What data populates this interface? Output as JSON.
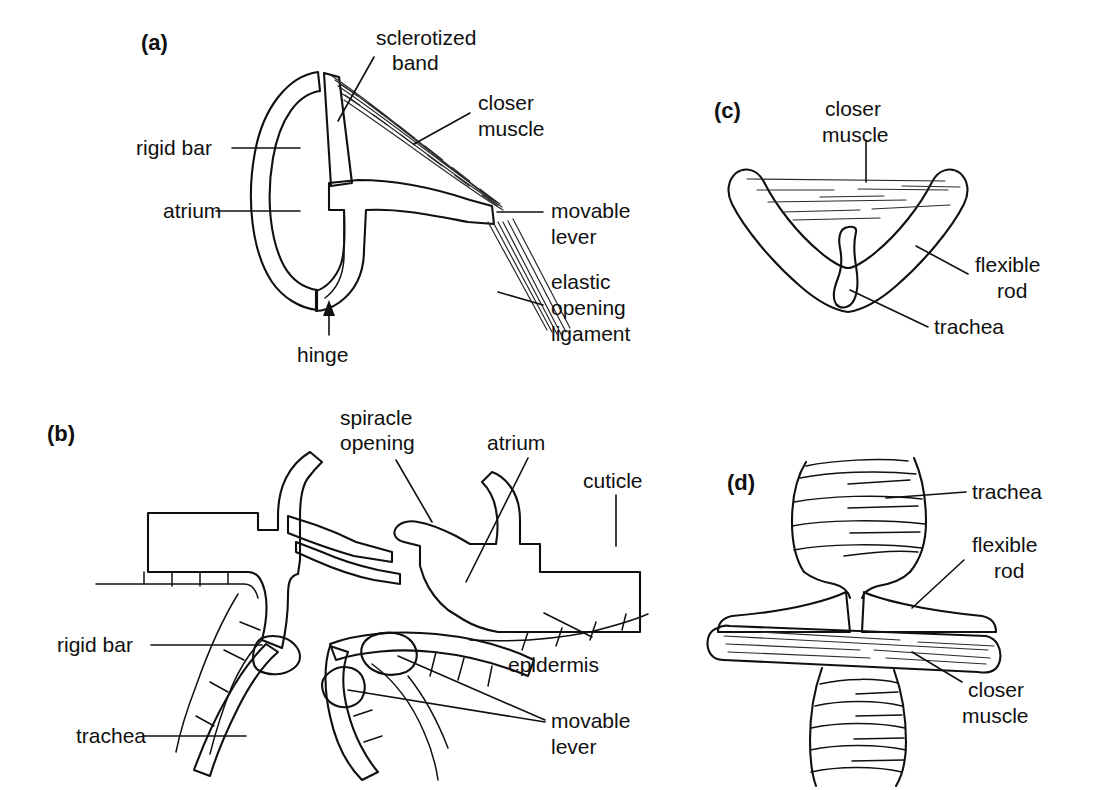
{
  "figure": {
    "background_color": "#ffffff",
    "ink_color": "#101010",
    "panels": [
      {
        "id": "a",
        "letter": "(a)",
        "description": "Lateral view of a spiracle with rigid bar, movable lever, closer muscle and elastic opening ligament",
        "labels": [
          "sclerotized band",
          "closer muscle",
          "rigid bar",
          "atrium",
          "movable lever",
          "elastic opening ligament",
          "hinge"
        ]
      },
      {
        "id": "b",
        "letter": "(b)",
        "description": "Sectional view through the body wall showing spiracle opening, atrium, cuticle, epidermis, rigid bar, movable lever and trachea",
        "labels": [
          "spiracle opening",
          "atrium",
          "cuticle",
          "epidermis",
          "rigid bar",
          "movable lever",
          "trachea"
        ]
      },
      {
        "id": "c",
        "letter": "(c)",
        "description": "Cross-section of a tracheal closing device with flexible rod, closer muscle and trachea",
        "labels": [
          "closer muscle",
          "flexible rod",
          "trachea"
        ]
      },
      {
        "id": "d",
        "letter": "(d)",
        "description": "Longitudinal view of a tracheal closing device with trachea, flexible rod and closer muscle",
        "labels": [
          "trachea",
          "flexible rod",
          "closer muscle"
        ]
      }
    ]
  },
  "panel_a": {
    "letter": "(a)",
    "label_sclerotized_band_line1": "sclerotized",
    "label_sclerotized_band_line2": "band",
    "label_closer_muscle_line1": "closer",
    "label_closer_muscle_line2": "muscle",
    "label_rigid_bar": "rigid bar",
    "label_atrium": "atrium",
    "label_movable_lever_line1": "movable",
    "label_movable_lever_line2": "lever",
    "label_elastic_line1": "elastic",
    "label_elastic_line2": "opening",
    "label_elastic_line3": "ligament",
    "label_hinge": "hinge"
  },
  "panel_b": {
    "letter": "(b)",
    "label_spiracle_opening_line1": "spiracle",
    "label_spiracle_opening_line2": "opening",
    "label_atrium": "atrium",
    "label_cuticle": "cuticle",
    "label_epidermis": "epidermis",
    "label_rigid_bar": "rigid bar",
    "label_movable_lever_line1": "movable",
    "label_movable_lever_line2": "lever",
    "label_trachea": "trachea"
  },
  "panel_c": {
    "letter": "(c)",
    "label_closer_muscle_line1": "closer",
    "label_closer_muscle_line2": "muscle",
    "label_flexible_rod_line1": "flexible",
    "label_flexible_rod_line2": "rod",
    "label_trachea": "trachea"
  },
  "panel_d": {
    "letter": "(d)",
    "label_trachea": "trachea",
    "label_flexible_rod_line1": "flexible",
    "label_flexible_rod_line2": "rod",
    "label_closer_muscle_line1": "closer",
    "label_closer_muscle_line2": "muscle"
  }
}
